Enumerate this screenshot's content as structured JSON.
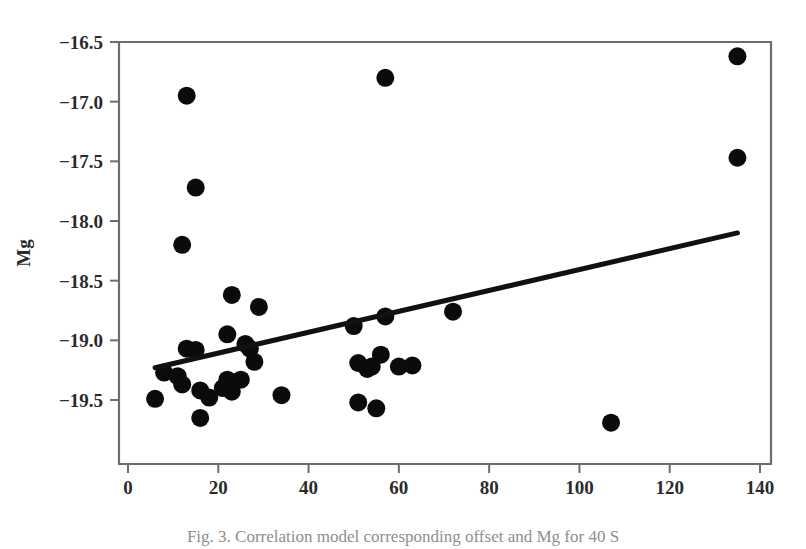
{
  "figure": {
    "caption": "Fig. 3.  Correlation  model  corresponding  offset  and  Mg  for  40 S",
    "y_axis_label": "Mg",
    "x_axis_label": "offset",
    "point_color": "#0b0b0b",
    "fitline_color": "#111111",
    "axis_color": "#6d6d6d"
  },
  "chart_data": {
    "type": "scatter",
    "title": "",
    "xlabel": "offset",
    "ylabel": "Mg",
    "xlim": [
      0,
      140
    ],
    "ylim": [
      -19.75,
      -16.45
    ],
    "grid": false,
    "legend": "none",
    "xticks": [
      0,
      20,
      40,
      60,
      80,
      100,
      120,
      140
    ],
    "xtick_labels": [
      "0",
      "20",
      "40",
      "60",
      "80",
      "100",
      "120",
      "140"
    ],
    "yticks": [
      -16.5,
      -17.0,
      -17.5,
      -18.0,
      -18.5,
      -19.0,
      -19.5
    ],
    "ytick_labels": [
      "-16.5",
      "-17.0",
      "-17.5",
      "-18.0",
      "-18.5",
      "-19.0",
      "-19.5"
    ],
    "marker": "circle",
    "marker_size": 9,
    "points": [
      {
        "x": 13,
        "y": -16.95
      },
      {
        "x": 15,
        "y": -17.72
      },
      {
        "x": 12,
        "y": -18.2
      },
      {
        "x": 57,
        "y": -16.8
      },
      {
        "x": 135,
        "y": -16.62
      },
      {
        "x": 135,
        "y": -17.47
      },
      {
        "x": 23,
        "y": -18.62
      },
      {
        "x": 29,
        "y": -18.72
      },
      {
        "x": 22,
        "y": -18.95
      },
      {
        "x": 26,
        "y": -19.03
      },
      {
        "x": 27,
        "y": -19.07
      },
      {
        "x": 13,
        "y": -19.07
      },
      {
        "x": 15,
        "y": -19.08
      },
      {
        "x": 28,
        "y": -19.18
      },
      {
        "x": 8,
        "y": -19.27
      },
      {
        "x": 11,
        "y": -19.3
      },
      {
        "x": 12,
        "y": -19.37
      },
      {
        "x": 16,
        "y": -19.42
      },
      {
        "x": 21,
        "y": -19.4
      },
      {
        "x": 23,
        "y": -19.43
      },
      {
        "x": 22,
        "y": -19.33
      },
      {
        "x": 25,
        "y": -19.33
      },
      {
        "x": 6,
        "y": -19.49
      },
      {
        "x": 18,
        "y": -19.48
      },
      {
        "x": 16,
        "y": -19.65
      },
      {
        "x": 34,
        "y": -19.46
      },
      {
        "x": 51,
        "y": -19.19
      },
      {
        "x": 53,
        "y": -19.24
      },
      {
        "x": 54,
        "y": -19.22
      },
      {
        "x": 51,
        "y": -19.52
      },
      {
        "x": 55,
        "y": -19.57
      },
      {
        "x": 50,
        "y": -18.88
      },
      {
        "x": 57,
        "y": -18.8
      },
      {
        "x": 72,
        "y": -18.76
      },
      {
        "x": 56,
        "y": -19.12
      },
      {
        "x": 60,
        "y": -19.22
      },
      {
        "x": 63,
        "y": -19.21
      },
      {
        "x": 107,
        "y": -19.69
      }
    ],
    "fit_line": {
      "label": "linear fit",
      "x_start": 6,
      "y_start": -19.23,
      "x_end": 135,
      "y_end": -18.1
    }
  }
}
